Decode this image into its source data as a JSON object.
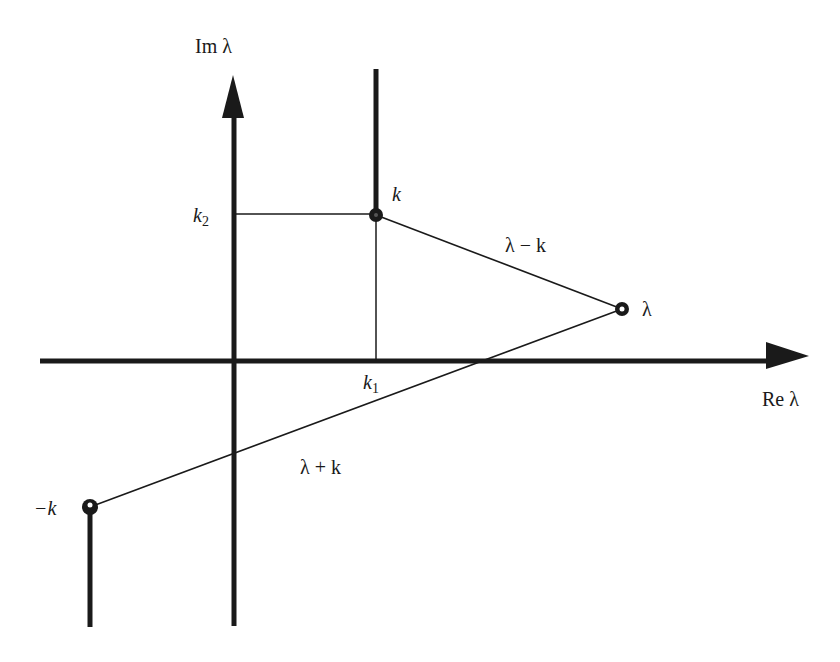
{
  "diagram": {
    "type": "complex-plane branch-cut diagram",
    "colors": {
      "ink": "#1a1a1a",
      "background": "#ffffff"
    },
    "axes": {
      "imag_label": "Im λ",
      "real_label": "Re λ"
    },
    "points": {
      "k": {
        "label": "k"
      },
      "lambda": {
        "label": "λ"
      },
      "neg_k": {
        "label": "−k"
      }
    },
    "projections": {
      "k1": {
        "base": "k",
        "sub": "1"
      },
      "k2": {
        "base": "k",
        "sub": "2"
      }
    },
    "segments": {
      "lambda_minus_k": "λ − k",
      "lambda_plus_k": "λ + k"
    },
    "branch_cuts": [
      {
        "from": "k",
        "direction": "up"
      },
      {
        "from": "−k",
        "direction": "down"
      }
    ]
  }
}
